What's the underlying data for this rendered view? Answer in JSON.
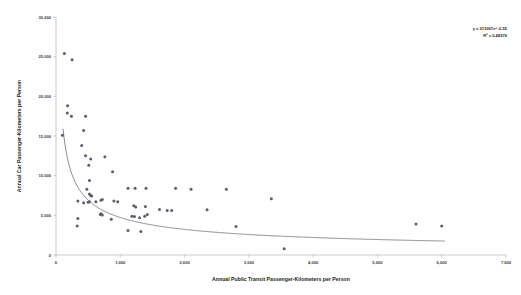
{
  "chart_data": {
    "type": "scatter",
    "title": "",
    "xlabel": "Annual Public Transit Passenger-Kilometers per Person",
    "ylabel": "Annual Car Passenger-Kilometers per Person",
    "xlim": [
      0,
      7000
    ],
    "ylim": [
      0,
      30000
    ],
    "xticks": [
      "0",
      "1,000",
      "2,000",
      "3,000",
      "4,000",
      "5,000",
      "6,000",
      "7,000"
    ],
    "xtick_values": [
      0,
      1000,
      2000,
      3000,
      4000,
      5000,
      6000,
      7000
    ],
    "yticks": [
      "0",
      "5,000",
      "10,000",
      "15,000",
      "20,000",
      "25,000",
      "30,000"
    ],
    "ytick_values": [
      0,
      5000,
      10000,
      15000,
      20000,
      25000,
      30000
    ],
    "grid": false,
    "legend": false,
    "marker_color": "#5c5c6e",
    "trendline_color": "#6a6a78",
    "annotation_line1": "y = 211067x^-0.55",
    "annotation_line2": "R² = 0.48376",
    "trendline_type": "power",
    "trendline_coefficient": 211067,
    "trendline_exponent": -0.55,
    "r_squared": 0.48376,
    "points": [
      [
        130,
        25400
      ],
      [
        250,
        24600
      ],
      [
        100,
        15100
      ],
      [
        180,
        18800
      ],
      [
        175,
        17900
      ],
      [
        240,
        17500
      ],
      [
        460,
        17500
      ],
      [
        430,
        15700
      ],
      [
        400,
        13800
      ],
      [
        460,
        12500
      ],
      [
        540,
        12100
      ],
      [
        760,
        12400
      ],
      [
        510,
        11300
      ],
      [
        880,
        10500
      ],
      [
        520,
        9400
      ],
      [
        1120,
        8400
      ],
      [
        1230,
        8400
      ],
      [
        480,
        8300
      ],
      [
        1400,
        8400
      ],
      [
        1860,
        8400
      ],
      [
        2100,
        8300
      ],
      [
        2650,
        8300
      ],
      [
        520,
        7700
      ],
      [
        540,
        7500
      ],
      [
        555,
        7450
      ],
      [
        3350,
        7100
      ],
      [
        340,
        6800
      ],
      [
        430,
        6600
      ],
      [
        500,
        6650
      ],
      [
        520,
        6700
      ],
      [
        620,
        6700
      ],
      [
        700,
        6900
      ],
      [
        720,
        7000
      ],
      [
        900,
        6800
      ],
      [
        960,
        6700
      ],
      [
        1210,
        6200
      ],
      [
        1240,
        6050
      ],
      [
        1390,
        6100
      ],
      [
        1610,
        5750
      ],
      [
        1730,
        5600
      ],
      [
        1800,
        5600
      ],
      [
        2350,
        5700
      ],
      [
        700,
        5200
      ],
      [
        720,
        5050
      ],
      [
        690,
        5100
      ],
      [
        1180,
        4900
      ],
      [
        1220,
        4850
      ],
      [
        1300,
        4700
      ],
      [
        1380,
        4900
      ],
      [
        1420,
        5100
      ],
      [
        340,
        4600
      ],
      [
        860,
        4500
      ],
      [
        330,
        3650
      ],
      [
        2800,
        3600
      ],
      [
        1120,
        3100
      ],
      [
        1320,
        2950
      ],
      [
        5600,
        3900
      ],
      [
        6000,
        3650
      ],
      [
        3550,
        800
      ]
    ]
  }
}
